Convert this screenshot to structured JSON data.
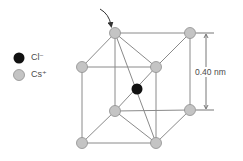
{
  "diagram": {
    "legend": [
      {
        "ion": "Cl",
        "charge": "−",
        "color": "#111111",
        "label": "Cl⁻"
      },
      {
        "ion": "Cs",
        "charge": "+",
        "color": "#c4c4c4",
        "label": "Cs⁺"
      }
    ],
    "dimension_label": "0.40 nm",
    "colors": {
      "line": "#8a8a8a",
      "atom_gray": "#c4c4c4",
      "atom_gray_stroke": "#8e8e8e",
      "atom_black": "#111111",
      "text": "#4a4a4a"
    },
    "atoms": [
      {
        "id": "back-top-left",
        "type": "Cs",
        "x": 115,
        "y": 33
      },
      {
        "id": "back-top-right",
        "type": "Cs",
        "x": 190,
        "y": 33
      },
      {
        "id": "front-top-left",
        "type": "Cs",
        "x": 82,
        "y": 67
      },
      {
        "id": "front-top-right",
        "type": "Cs",
        "x": 156,
        "y": 67
      },
      {
        "id": "center",
        "type": "Cl",
        "x": 137,
        "y": 89
      },
      {
        "id": "back-bottom-left",
        "type": "Cs",
        "x": 115,
        "y": 111
      },
      {
        "id": "back-bottom-right",
        "type": "Cs",
        "x": 190,
        "y": 110
      },
      {
        "id": "front-bottom-left",
        "type": "Cs",
        "x": 82,
        "y": 143
      },
      {
        "id": "front-bottom-right",
        "type": "Cs",
        "x": 156,
        "y": 143
      }
    ]
  }
}
